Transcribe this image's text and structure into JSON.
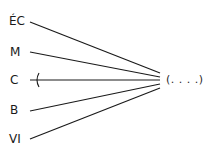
{
  "diagram": {
    "type": "many-to-one",
    "sources": [
      {
        "label": "ÉC",
        "y": 22,
        "crossed": false
      },
      {
        "label": "M",
        "y": 52,
        "crossed": false
      },
      {
        "label": "C",
        "y": 80,
        "crossed": true
      },
      {
        "label": "B",
        "y": 111,
        "crossed": false
      },
      {
        "label": "VI",
        "y": 139,
        "crossed": false
      }
    ],
    "target": {
      "label": "(. . . .)"
    },
    "colors": {
      "line": "#1a1a1a",
      "text": "#1a1a1a"
    }
  }
}
